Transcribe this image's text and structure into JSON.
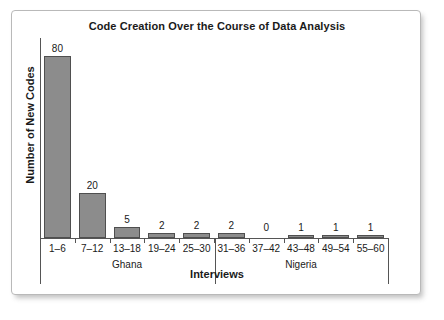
{
  "chart_data": {
    "type": "bar",
    "title": "Code Creation Over the Course of Data Analysis",
    "xlabel": "Interviews",
    "ylabel": "Number of New Codes",
    "categories": [
      "1–6",
      "7–12",
      "13–18",
      "19–24",
      "25–30",
      "31–36",
      "37–42",
      "43–48",
      "49–54",
      "55–60"
    ],
    "values": [
      80,
      20,
      5,
      2,
      2,
      2,
      0,
      1,
      1,
      1
    ],
    "value_labels": [
      "80",
      "20",
      "5",
      "2",
      "2",
      "2",
      "0",
      "1",
      "1",
      "1"
    ],
    "ylim": [
      0,
      88
    ],
    "grid": false,
    "legend": "none",
    "groups": [
      {
        "label": "Ghana",
        "categories": [
          "1–6",
          "7–12",
          "13–18",
          "19–24",
          "25–30"
        ]
      },
      {
        "label": "Nigeria",
        "categories": [
          "31–36",
          "37–42",
          "43–48",
          "49–54",
          "55–60"
        ]
      }
    ],
    "colors": {
      "bar_fill": "#8c8c8c",
      "bar_edge": "#4f4f4f",
      "axis": "#555555",
      "text": "#1a1a1a",
      "frame": "#b9b9b9",
      "background": "#ffffff"
    }
  }
}
